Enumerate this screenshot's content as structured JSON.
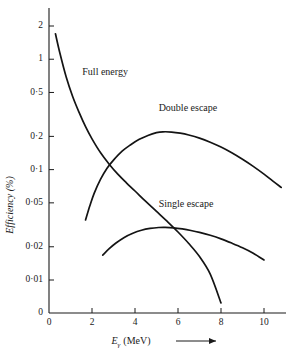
{
  "chart_data": {
    "type": "line",
    "title": "",
    "xlabel": "Eγ (MeV)",
    "xlabel_main": "E",
    "xlabel_sub": "γ",
    "xlabel_unit": "(MeV)",
    "ylabel": "Efficiency (%)",
    "xlim": [
      0,
      11
    ],
    "ylim": [
      0.005,
      2.6
    ],
    "yscale": "log",
    "xscale": "linear",
    "grid": false,
    "legend_position": "inline-annotations",
    "xticks": [
      0,
      2,
      4,
      6,
      8,
      10
    ],
    "xtick_labels": [
      "0",
      "2",
      "4",
      "6",
      "8",
      "10"
    ],
    "yticks": [
      2,
      1,
      0.5,
      0.2,
      0.1,
      0.05,
      0.02,
      0.01,
      0
    ],
    "ytick_labels": [
      "2",
      "1",
      "0·5",
      "0·2",
      "0·1",
      "0·05",
      "0·02",
      "0·01",
      "0"
    ],
    "series": [
      {
        "name": "Full energy",
        "label": "Full energy",
        "label_x": 1.55,
        "label_y": 0.72,
        "x": [
          0.3,
          0.5,
          0.8,
          1.1,
          1.4,
          1.7,
          2.0,
          2.4,
          2.8,
          3.2,
          3.6,
          4.0,
          4.5,
          5.0,
          5.5,
          6.0,
          6.5,
          7.0,
          7.5,
          8.0
        ],
        "values": [
          1.7,
          1.15,
          0.69,
          0.46,
          0.33,
          0.245,
          0.19,
          0.142,
          0.112,
          0.091,
          0.076,
          0.064,
          0.0515,
          0.0418,
          0.0339,
          0.0272,
          0.0214,
          0.0163,
          0.0113,
          0.0062
        ]
      },
      {
        "name": "Double escape",
        "label": "Double escape",
        "label_x": 5.1,
        "label_y": 0.34,
        "x": [
          1.7,
          1.9,
          2.1,
          2.4,
          2.7,
          3.0,
          3.4,
          3.8,
          4.2,
          4.6,
          5.0,
          5.3,
          5.7,
          6.1,
          6.5,
          7.0,
          7.5,
          8.0,
          8.5,
          9.0,
          9.5,
          10.0,
          10.4,
          10.8
        ],
        "values": [
          0.035,
          0.047,
          0.061,
          0.082,
          0.103,
          0.122,
          0.147,
          0.168,
          0.188,
          0.204,
          0.216,
          0.22,
          0.219,
          0.214,
          0.206,
          0.193,
          0.177,
          0.16,
          0.142,
          0.124,
          0.107,
          0.091,
          0.079,
          0.069
        ]
      },
      {
        "name": "Single escape",
        "label": "Single escape",
        "label_x": 5.1,
        "label_y": 0.046,
        "x": [
          2.5,
          2.8,
          3.1,
          3.5,
          3.9,
          4.3,
          4.7,
          5.1,
          5.4,
          5.8,
          6.2,
          6.6,
          7.0,
          7.5,
          8.0,
          8.5,
          9.0,
          9.5,
          10.0
        ],
        "values": [
          0.0168,
          0.0192,
          0.0215,
          0.0243,
          0.0265,
          0.0282,
          0.0293,
          0.0299,
          0.03,
          0.0297,
          0.029,
          0.0281,
          0.027,
          0.0254,
          0.0236,
          0.0216,
          0.0196,
          0.0175,
          0.0152
        ]
      }
    ]
  }
}
